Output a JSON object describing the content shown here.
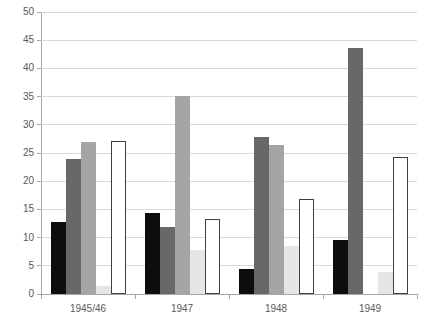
{
  "chart_data": {
    "type": "bar",
    "title": "",
    "subtitle": "",
    "xlabel": "",
    "ylabel": "",
    "categories": [
      "1945/46",
      "1947",
      "1948",
      "1949"
    ],
    "ylim": [
      0,
      50
    ],
    "ytick_step": 5,
    "yticks": [
      0,
      5,
      10,
      15,
      20,
      25,
      30,
      35,
      40,
      45,
      50
    ],
    "ytick_labels": [
      "0",
      "5",
      "10",
      "15",
      "20",
      "25",
      "30",
      "35",
      "40",
      "45",
      "50"
    ],
    "grid": true,
    "grid_axis": "y",
    "legend": "none-visible",
    "series": [
      {
        "name": "series-1",
        "color": "#0d0d0d",
        "style": "solid-black",
        "values": [
          12.7,
          14.3,
          4.4,
          9.6
        ]
      },
      {
        "name": "series-2",
        "color": "#686868",
        "style": "solid-dark-gray",
        "values": [
          24.0,
          11.9,
          27.8,
          43.6
        ]
      },
      {
        "name": "series-3",
        "color": "#a5a5a5",
        "style": "solid-mid-gray",
        "values": [
          27.0,
          35.1,
          26.4,
          0.0
        ]
      },
      {
        "name": "series-4",
        "color": "#e6e6e6",
        "style": "solid-light-gray",
        "values": [
          1.5,
          7.8,
          8.6,
          3.9
        ]
      },
      {
        "name": "series-5",
        "color": "#ffffff",
        "style": "outlined-white",
        "values": [
          27.2,
          13.3,
          16.8,
          24.3
        ]
      }
    ]
  },
  "axes": {
    "y_axis_color": "#a6a6a6",
    "grid_color": "#d9d9d9",
    "tick_label_color": "#595959"
  },
  "footer": {
    "cut_off_caption": ""
  }
}
